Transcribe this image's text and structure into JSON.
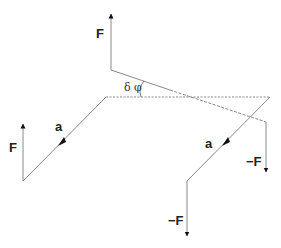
{
  "diagram": {
    "labels": {
      "force_top": "F",
      "force_left": "F",
      "force_right": "−F",
      "force_bottom": "−F",
      "vector_left": "a",
      "vector_right": "a",
      "angle": "δ φ"
    },
    "colors": {
      "line": "#777777",
      "arrow": "#111111",
      "text": "#222222"
    }
  }
}
